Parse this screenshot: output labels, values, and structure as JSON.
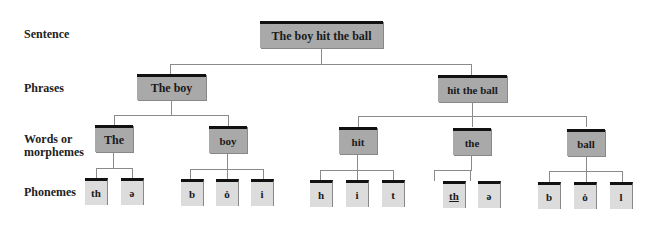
{
  "levels": {
    "sentence": "Sentence",
    "phrases": "Phrases",
    "words_line1": "Words or",
    "words_line2": "morphemes",
    "phonemes": "Phonemes"
  },
  "sentence": "The boy hit the ball",
  "phrases": [
    "The boy",
    "hit the ball"
  ],
  "words": [
    "The",
    "boy",
    "hit",
    "the",
    "ball"
  ],
  "phonemes": {
    "The": [
      "th",
      "ə"
    ],
    "boy": [
      "b",
      "ȯ",
      "i"
    ],
    "hit": [
      "h",
      "i",
      "t"
    ],
    "the": [
      "th",
      "ə"
    ],
    "ball": [
      "b",
      "ȯ",
      "l"
    ]
  },
  "colors": {
    "node_dark": "#a9a9a9",
    "node_light": "#dcdcdc",
    "top_bar": "#111111",
    "connector": "#8a8a8a"
  }
}
